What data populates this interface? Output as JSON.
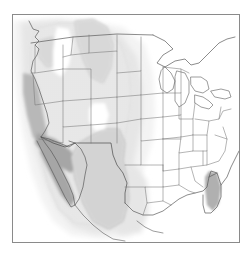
{
  "figure": {
    "title": "",
    "type": "shaded-contour-map",
    "region": "North America (contiguous United States, southern Canada, northern Mexico)",
    "projection_hint": "conic",
    "frame": {
      "x": 12,
      "y": 14,
      "width": 226,
      "height": 227,
      "border_color": "#8a8a8a",
      "background": "#ffffff"
    }
  },
  "colors": {
    "background": "#ffffff",
    "frame_border": "#8a8a8a",
    "coastline": "#555555",
    "state_border": "#777777",
    "country_border": "#4a4a4a",
    "shade_level_1": "#f2f2f2",
    "shade_level_2": "#e2e2e2",
    "shade_level_3": "#cfcfcf",
    "shade_level_4": "#b4b4b4",
    "shade_level_5": "#a0a0a0"
  },
  "chart_data": {
    "type": "heatmap",
    "title": "",
    "xlabel": "",
    "ylabel": "",
    "grid": false,
    "legend_position": "none",
    "shading_scale": {
      "description": "Grayscale shading intensity; darker indicates larger magnitude",
      "levels": [
        {
          "index": 1,
          "label": "lightest",
          "color": "#f2f2f2"
        },
        {
          "index": 2,
          "label": "light",
          "color": "#e2e2e2"
        },
        {
          "index": 3,
          "label": "medium",
          "color": "#cfcfcf"
        },
        {
          "index": 4,
          "label": "dark",
          "color": "#b4b4b4"
        },
        {
          "index": 5,
          "label": "darkest",
          "color": "#a0a0a0"
        }
      ]
    },
    "shaded_regions": [
      {
        "name": "outer-western-envelope",
        "level": 1,
        "extent": "Pacific Northwest through Great Plains to central Texas"
      },
      {
        "name": "intermountain-west",
        "level": 3,
        "extent": "Nevada, Utah, Arizona, New Mexico, Colorado, Wyoming, Montana"
      },
      {
        "name": "northern-rockies-lobe",
        "level": 4,
        "extent": "Montana / Alberta border region"
      },
      {
        "name": "pacific-northwest-patch",
        "level": 4,
        "extent": "eastern Washington / northern Idaho"
      },
      {
        "name": "southwest-core",
        "level": 5,
        "extent": "northern Mexico, Baja California, southern Arizona, southern New Mexico, west Texas"
      },
      {
        "name": "baja-coastal-strip",
        "level": 5,
        "extent": "Baja California peninsula west coast"
      },
      {
        "name": "southern-california-coast",
        "level": 4,
        "extent": "California coastal ranges"
      },
      {
        "name": "florida-gulf-strip",
        "level": 4,
        "extent": "west coast of Florida peninsula"
      },
      {
        "name": "idaho-washington-hole",
        "level": 0,
        "extent": "unshaded gap over Idaho / eastern Washington"
      },
      {
        "name": "colorado-hole",
        "level": 0,
        "extent": "unshaded gap over eastern Colorado"
      }
    ]
  },
  "map_features": {
    "coastlines": [
      "Pacific coast",
      "Gulf of Mexico",
      "Atlantic coast",
      "Great Lakes",
      "Gulf of California",
      "Baja California"
    ],
    "borders": [
      "United States state boundaries",
      "United States - Canada border",
      "United States - Mexico border"
    ]
  }
}
